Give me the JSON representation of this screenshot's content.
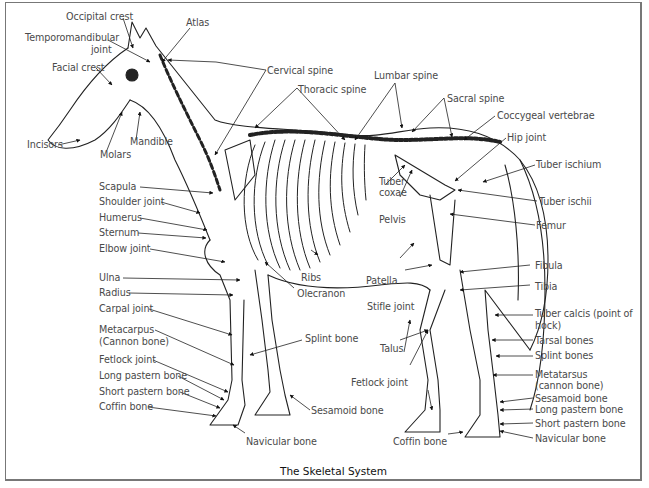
{
  "figure": {
    "caption": "The Skeletal System"
  },
  "labels": {
    "occipital_crest": "Occipital crest",
    "atlas": "Atlas",
    "temporomandibular_joint_1": "Temporomandibular",
    "temporomandibular_joint_2": "joint",
    "facial_crest": "Facial crest",
    "incisors": "Incisors",
    "molars": "Molars",
    "mandible": "Mandible",
    "cervical_spine": "Cervical spine",
    "thoracic_spine": "Thoracic spine",
    "lumbar_spine": "Lumbar spine",
    "sacral_spine": "Sacral spine",
    "coccygeal_vertebrae": "Coccygeal vertebrae",
    "hip_joint": "Hip joint",
    "tuber_ischium": "Tuber ischium",
    "tuber_ischii": "Tuber ischii",
    "tuber_coxae_1": "Tuber",
    "tuber_coxae_2": "coxae",
    "pelvis": "Pelvis",
    "femur": "Femur",
    "fibula": "Fibula",
    "tibia": "Tibia",
    "tuber_calcis_1": "Tuber calcis (point of",
    "tuber_calcis_2": "hock)",
    "tarsal_bones": "Tarsal bones",
    "splint_bones": "Splint bones",
    "metatarsus_1": "Metatarsus",
    "metatarsus_2": "(cannon bone)",
    "sesamoid_bone_hind": "Sesamoid bone",
    "long_pastern_hind": "Long pastern bone",
    "short_pastern_hind": "Short pastern bone",
    "navicular_hind": "Navicular bone",
    "scapula": "Scapula",
    "shoulder_joint": "Shoulder joint",
    "humerus": "Humerus",
    "sternum": "Sternum",
    "elbow_joint": "Elbow joint",
    "ulna": "Ulna",
    "radius": "Radius",
    "carpal_joint": "Carpal joint",
    "metacarpus_1": "Metacarpus",
    "metacarpus_2": "(Cannon bone)",
    "fetlock_joint_fore": "Fetlock joint",
    "long_pastern_fore": "Long pastern bone",
    "short_pastern_fore": "Short pastern bone",
    "coffin_bone_fore": "Coffin bone",
    "navicular_fore": "Navicular bone",
    "ribs": "Ribs",
    "olecranon": "Olecranon",
    "splint_bone_fore": "Splint bone",
    "sesamoid_bone_fore": "Sesamoid bone",
    "patella": "Patella",
    "stifle_joint": "Stifle joint",
    "talus": "Talus",
    "fetlock_joint_hind": "Fetlock joint",
    "coffin_bone_hind": "Coffin bone"
  }
}
